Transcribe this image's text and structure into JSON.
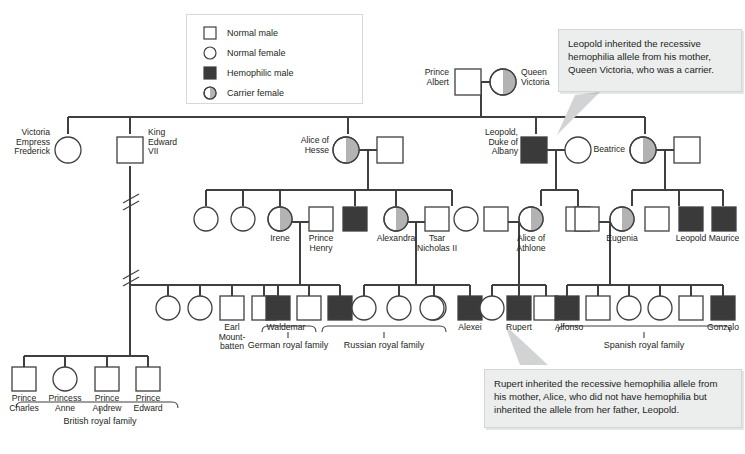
{
  "colors": {
    "line": "#3f3f3f",
    "affected_fill": "#3a3a3a",
    "carrier_fill": "#b3b3b3",
    "normal_fill": "#ffffff",
    "callout_bg": "#eceded",
    "text": "#231f20"
  },
  "legend": {
    "items": [
      {
        "symbol": "square-open",
        "label": "Normal male"
      },
      {
        "symbol": "circle-open",
        "label": "Normal female"
      },
      {
        "symbol": "square-filled",
        "label": "Hemophilic male"
      },
      {
        "symbol": "circle-half-filled",
        "label": "Carrier female"
      }
    ]
  },
  "callouts": [
    {
      "id": "leopold",
      "text": "Leopold inherited the recessive hemophilia allele from his mother, Queen Victoria, who was a carrier."
    },
    {
      "id": "rupert",
      "text": "Rupert inherited the recessive hemophilia allele from his mother, Alice, who did not have hemophilia but inherited the allele from her father, Leopold."
    }
  ],
  "generations": [
    {
      "id": "gen1",
      "individuals": [
        {
          "id": "albert",
          "type": "square-open",
          "label": "Prince\nAlbert",
          "label_pos": "left"
        },
        {
          "id": "victoria",
          "type": "circle-half-filled",
          "label": "Queen\nVictoria",
          "label_pos": "right"
        }
      ]
    },
    {
      "id": "gen2",
      "individuals": [
        {
          "id": "vef",
          "type": "circle-open",
          "label": "Victoria\nEmpress\nFrederick",
          "label_pos": "left"
        },
        {
          "id": "edward7",
          "type": "square-open",
          "label": "King\nEdward\nVII",
          "label_pos": "right"
        },
        {
          "id": "alice-hesse",
          "type": "circle-half-filled",
          "label": "Alice of\nHesse",
          "label_pos": "left"
        },
        {
          "id": "alice-spouse",
          "type": "square-open",
          "label": "",
          "label_pos": "none"
        },
        {
          "id": "leopold-albany",
          "type": "square-filled",
          "label": "Leopold,\nDuke of\nAlbany",
          "label_pos": "left"
        },
        {
          "id": "leopold-spouse",
          "type": "circle-open",
          "label": "",
          "label_pos": "none"
        },
        {
          "id": "beatrice",
          "type": "circle-half-filled",
          "label": "Beatrice",
          "label_pos": "left"
        },
        {
          "id": "beatrice-spouse",
          "type": "square-open",
          "label": "",
          "label_pos": "none"
        }
      ]
    },
    {
      "id": "gen3",
      "individuals": [
        {
          "id": "g3a",
          "type": "circle-open",
          "label": "",
          "label_pos": "none"
        },
        {
          "id": "g3b",
          "type": "circle-open",
          "label": "",
          "label_pos": "none"
        },
        {
          "id": "irene",
          "type": "circle-half-filled",
          "label": "Irene",
          "label_pos": "below"
        },
        {
          "id": "prince-henry",
          "type": "square-open",
          "label": "Prince\nHenry",
          "label_pos": "below"
        },
        {
          "id": "g3-hem1",
          "type": "square-filled",
          "label": "",
          "label_pos": "none"
        },
        {
          "id": "alexandra",
          "type": "circle-half-filled",
          "label": "Alexandra",
          "label_pos": "below"
        },
        {
          "id": "nicholas2",
          "type": "square-open",
          "label": "Tsar\nNicholas II",
          "label_pos": "below"
        },
        {
          "id": "g3c",
          "type": "circle-open",
          "label": "",
          "label_pos": "none"
        },
        {
          "id": "athlone-spouse",
          "type": "square-open",
          "label": "",
          "label_pos": "none"
        },
        {
          "id": "alice-athlone",
          "type": "circle-half-filled",
          "label": "Alice of\nAthlone",
          "label_pos": "below"
        },
        {
          "id": "g3d",
          "type": "square-open",
          "label": "",
          "label_pos": "none"
        },
        {
          "id": "eugenia-spouse",
          "type": "square-open",
          "label": "",
          "label_pos": "none"
        },
        {
          "id": "eugenia",
          "type": "circle-half-filled",
          "label": "Eugenia",
          "label_pos": "below"
        },
        {
          "id": "g3e",
          "type": "square-open",
          "label": "",
          "label_pos": "none"
        },
        {
          "id": "leopold2",
          "type": "square-filled",
          "label": "Leopold",
          "label_pos": "below"
        },
        {
          "id": "maurice",
          "type": "square-filled",
          "label": "Maurice",
          "label_pos": "below"
        }
      ]
    },
    {
      "id": "gen4",
      "individuals": [
        {
          "id": "g4a",
          "type": "circle-open",
          "label": "",
          "label_pos": "none"
        },
        {
          "id": "g4b",
          "type": "circle-open",
          "label": "",
          "label_pos": "none"
        },
        {
          "id": "mountbatten",
          "type": "square-open",
          "label": "Earl\nMount-\nbatten",
          "label_pos": "below"
        },
        {
          "id": "g4c",
          "type": "square-open",
          "label": "",
          "label_pos": "none"
        },
        {
          "id": "waldemar",
          "type": "square-filled",
          "label": "Waldemar",
          "label_pos": "below"
        },
        {
          "id": "g4d",
          "type": "square-open",
          "label": "",
          "label_pos": "none"
        },
        {
          "id": "g4e",
          "type": "square-filled",
          "label": "",
          "label_pos": "none"
        },
        {
          "id": "g4f",
          "type": "circle-open",
          "label": "",
          "label_pos": "none"
        },
        {
          "id": "g4g",
          "type": "circle-open",
          "label": "",
          "label_pos": "none"
        },
        {
          "id": "g4h",
          "type": "circle-open",
          "label": "",
          "label_pos": "none"
        },
        {
          "id": "g4i",
          "type": "circle-open",
          "label": "",
          "label_pos": "none"
        },
        {
          "id": "alexei",
          "type": "square-filled",
          "label": "Alexei",
          "label_pos": "below"
        },
        {
          "id": "g4j",
          "type": "circle-open",
          "label": "",
          "label_pos": "none"
        },
        {
          "id": "rupert",
          "type": "square-filled",
          "label": "Rupert",
          "label_pos": "below"
        },
        {
          "id": "g4k",
          "type": "square-open",
          "label": "",
          "label_pos": "none"
        },
        {
          "id": "alfonso",
          "type": "square-filled",
          "label": "Alfonso",
          "label_pos": "below"
        },
        {
          "id": "g4l",
          "type": "square-open",
          "label": "",
          "label_pos": "none"
        },
        {
          "id": "g4m",
          "type": "circle-open",
          "label": "",
          "label_pos": "none"
        },
        {
          "id": "g4n",
          "type": "circle-open",
          "label": "",
          "label_pos": "none"
        },
        {
          "id": "g4o",
          "type": "square-open",
          "label": "",
          "label_pos": "none"
        },
        {
          "id": "gonzalo",
          "type": "square-filled",
          "label": "Gonzalo",
          "label_pos": "below"
        }
      ]
    },
    {
      "id": "gen5",
      "individuals": [
        {
          "id": "charles",
          "type": "square-open",
          "label": "Prince\nCharles",
          "label_pos": "below"
        },
        {
          "id": "anne",
          "type": "circle-open",
          "label": "Princess\nAnne",
          "label_pos": "below"
        },
        {
          "id": "andrew",
          "type": "square-open",
          "label": "Prince\nAndrew",
          "label_pos": "below"
        },
        {
          "id": "edward",
          "type": "square-open",
          "label": "Prince\nEdward",
          "label_pos": "below"
        }
      ]
    }
  ],
  "family_labels": [
    {
      "id": "german",
      "label": "German royal family"
    },
    {
      "id": "russian",
      "label": "Russian royal family"
    },
    {
      "id": "spanish",
      "label": "Spanish royal family"
    },
    {
      "id": "british",
      "label": "British royal family"
    }
  ],
  "node_labels": {
    "albert": "Prince\nAlbert",
    "victoria": "Queen\nVictoria",
    "vef": "Victoria\nEmpress\nFrederick",
    "edward7": "King\nEdward\nVII",
    "alice_hesse": "Alice of\nHesse",
    "leopold_albany": "Leopold,\nDuke of\nAlbany",
    "beatrice": "Beatrice",
    "irene": "Irene",
    "prince_henry": "Prince\nHenry",
    "alexandra": "Alexandra",
    "nicholas2": "Tsar\nNicholas II",
    "alice_athlone": "Alice of\nAthlone",
    "eugenia": "Eugenia",
    "leopold2": "Leopold",
    "maurice": "Maurice",
    "mountbatten": "Earl\nMount-\nbatten",
    "waldemar": "Waldemar",
    "alexei": "Alexei",
    "rupert": "Rupert",
    "alfonso": "Alfonso",
    "gonzalo": "Gonzalo",
    "charles": "Prince\nCharles",
    "anne": "Princess\nAnne",
    "andrew": "Prince\nAndrew",
    "edward": "Prince\nEdward",
    "german_family": "German royal family",
    "russian_family": "Russian royal family",
    "spanish_family": "Spanish royal family",
    "british_family": "British royal family"
  }
}
